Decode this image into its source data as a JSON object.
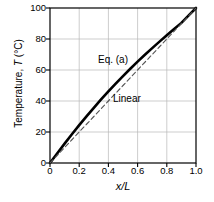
{
  "chart_data": {
    "type": "line",
    "title": "",
    "xlabel": "x/L",
    "ylabel": "Temperature, T (°C)",
    "xlim": [
      0,
      1.0
    ],
    "ylim": [
      0,
      100
    ],
    "grid": true,
    "legend_position": "inline-annotation",
    "xticks": [
      "0",
      "0.2",
      "0.4",
      "0.6",
      "0.8",
      "1.0"
    ],
    "xtick_values": [
      0,
      0.2,
      0.4,
      0.6,
      0.8,
      1.0
    ],
    "yticks": [
      "0",
      "20",
      "40",
      "60",
      "80",
      "100"
    ],
    "ytick_values": [
      0,
      20,
      40,
      60,
      80,
      100
    ],
    "x": [
      0,
      0.05,
      0.1,
      0.15,
      0.2,
      0.25,
      0.3,
      0.35,
      0.4,
      0.45,
      0.5,
      0.55,
      0.6,
      0.65,
      0.7,
      0.75,
      0.8,
      0.85,
      0.9,
      0.95,
      1.0
    ],
    "series": [
      {
        "name": "Eq. (a)",
        "style": "solid",
        "color": "#000000",
        "width": 2.6,
        "values": [
          0,
          6.3,
          12.5,
          18.5,
          24.4,
          30.1,
          35.6,
          41.0,
          46.2,
          51.2,
          56.1,
          60.8,
          65.4,
          69.8,
          74.1,
          78.3,
          82.4,
          86.4,
          90.4,
          95.2,
          100
        ]
      },
      {
        "name": "Linear",
        "style": "dashed",
        "color": "#555555",
        "width": 1.1,
        "values": [
          0,
          5,
          10,
          15,
          20,
          25,
          30,
          35,
          40,
          45,
          50,
          55,
          60,
          65,
          70,
          75,
          80,
          85,
          90,
          95,
          100
        ]
      }
    ],
    "annotations": [
      {
        "text": "Eq. (a)",
        "x": 0.42,
        "y": 66
      },
      {
        "text": "Linear",
        "x": 0.52,
        "y": 44
      }
    ]
  },
  "axis": {
    "y_title_prefix": "Temperature, ",
    "y_title_symbol": "T",
    "y_title_suffix": " (°C)",
    "x_title": "x/L"
  },
  "colors": {
    "axis": "#000000",
    "grid": "#b8b8b8",
    "curve": "#000000",
    "linear": "#555555",
    "background": "#ffffff"
  }
}
